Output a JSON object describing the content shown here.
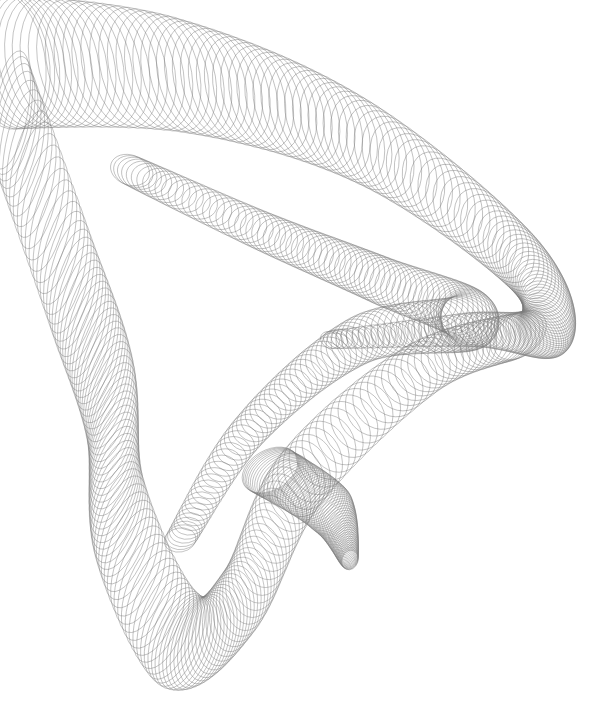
{
  "canvas": {
    "width": 599,
    "height": 705,
    "background": "#ffffff"
  },
  "artwork": {
    "description": "Grey harmonograph-style line art: a ribbon of overlapping elliptical loops sweeping from the top-left, curling to the right and folding down into a tapered point at the bottom",
    "stroke_color": "#7a7a7a",
    "stroke_width": 0.55,
    "stroke_opacity": 0.75,
    "ribbons": [
      {
        "name": "upper-sweep",
        "count": 140,
        "path": [
          [
            5,
            60
          ],
          [
            180,
            75
          ],
          [
            360,
            140
          ],
          [
            520,
            260
          ],
          [
            545,
            330
          ],
          [
            470,
            330
          ],
          [
            330,
            340
          ]
        ],
        "rx": [
          40,
          26,
          8
        ],
        "ry": [
          70,
          40,
          10
        ],
        "angle": [
          -10,
          -30,
          -60
        ]
      },
      {
        "name": "inner-fan",
        "count": 130,
        "path": [
          [
            130,
            170
          ],
          [
            260,
            230
          ],
          [
            380,
            280
          ],
          [
            470,
            320
          ],
          [
            360,
            340
          ],
          [
            250,
            430
          ],
          [
            180,
            540
          ]
        ],
        "rx": [
          20,
          30,
          12
        ],
        "ry": [
          15,
          28,
          16
        ],
        "angle": [
          20,
          40,
          80
        ]
      },
      {
        "name": "left-fold",
        "count": 140,
        "path": [
          [
            10,
            110
          ],
          [
            70,
            280
          ],
          [
            110,
            400
          ],
          [
            120,
            520
          ],
          [
            180,
            640
          ],
          [
            240,
            600
          ],
          [
            300,
            480
          ],
          [
            420,
            370
          ],
          [
            520,
            335
          ]
        ],
        "rx": [
          18,
          22,
          30
        ],
        "ry": [
          60,
          50,
          20
        ],
        "angle": [
          10,
          20,
          -40
        ]
      },
      {
        "name": "right-flap",
        "count": 60,
        "path": [
          [
            270,
            470
          ],
          [
            330,
            510
          ],
          [
            350,
            560
          ]
        ],
        "rx": [
          30,
          26,
          10
        ],
        "ry": [
          20,
          18,
          8
        ],
        "angle": [
          -30,
          -50,
          -70
        ]
      }
    ]
  }
}
